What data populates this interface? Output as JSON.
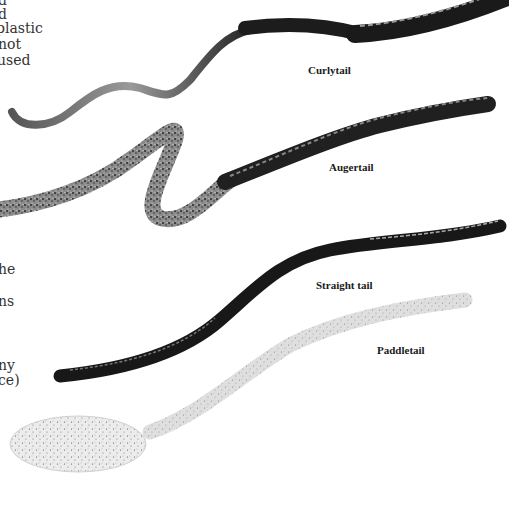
{
  "page": {
    "left_text_fragments": [
      {
        "text": "d",
        "top": -8
      },
      {
        "text": "d",
        "top": 6
      },
      {
        "text": "plastic",
        "top": 20
      },
      {
        "text": "not",
        "top": 36
      },
      {
        "text": "used",
        "top": 52
      },
      {
        "text": "he",
        "top": 261
      },
      {
        "text": "ns",
        "top": 293
      },
      {
        "text": "ny",
        "top": 357
      },
      {
        "text": "ce)",
        "top": 372
      }
    ],
    "captions": {
      "curlytail": "Curlytail",
      "augertail": "Augertail",
      "straight_tail": "Straight tail",
      "paddletail": "Paddletail"
    },
    "colors": {
      "background": "#ffffff",
      "worm_dark": "#1c1c1c",
      "worm_speckled": "#5a5a5a",
      "worm_clear": "#e6e6e6",
      "caption_text": "#1a1a1a"
    }
  }
}
